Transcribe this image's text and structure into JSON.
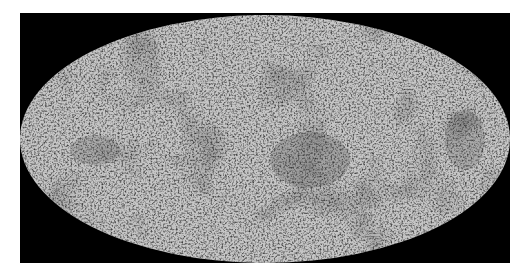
{
  "image": {
    "description": "All-sky map in Mollweide projection, grayscale mottled texture on black background",
    "projection": "mollweide",
    "colors": {
      "background_outer": "#ffffff",
      "frame": "#000000",
      "map_light": "#c8c8c8",
      "map_dark": "#555555"
    }
  }
}
